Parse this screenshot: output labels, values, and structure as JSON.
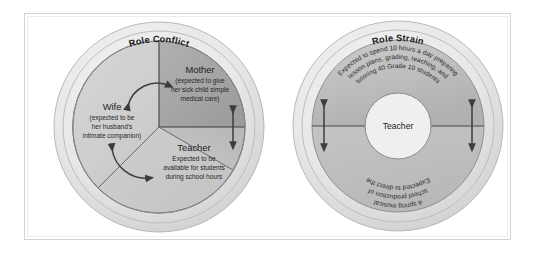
{
  "figure": {
    "background_color": "#ffffff",
    "frame_color": "#d2d2d2",
    "ring_outer_color": "#e9e9e9",
    "ring_inner_color": "#bdbdbd",
    "sector_fill_light": "#cfcfcf",
    "sector_fill_dark": "#a6a6a6",
    "line_color": "#4d4d4d"
  },
  "left_diagram": {
    "title": "Role Conflict",
    "sectors": [
      {
        "name": "mother-sector",
        "role": "Mother",
        "detail_lines": [
          "(expected to give",
          "her sick child simple",
          "medical care)"
        ]
      },
      {
        "name": "wife-sector",
        "role": "Wife",
        "detail_lines": [
          "(expected to be",
          "her husband's",
          "intimate companion)"
        ]
      },
      {
        "name": "teacher-sector",
        "role": "Teacher",
        "detail_lines": [
          "Expected to be",
          "available for students",
          "during school hours"
        ]
      }
    ],
    "arrows": [
      {
        "name": "arrow-wife-mother",
        "style": "curved-double-headed"
      },
      {
        "name": "arrow-mother-teacher",
        "style": "straight-double-headed"
      },
      {
        "name": "arrow-wife-teacher",
        "style": "curved-double-headed"
      }
    ]
  },
  "right_diagram": {
    "title": "Role Strain",
    "center_label": "Teacher",
    "upper_arc_lines": [
      "Expected to spend 10 hours a day preparing",
      "lesson plans, grading, teaching, and",
      "tutoring 40 Grade 10 students"
    ],
    "lower_arc_lines": [
      "Expected to direct the",
      "school production of",
      "a spring musical"
    ],
    "arrows": [
      {
        "name": "arrow-left-strain",
        "style": "straight-double-headed"
      },
      {
        "name": "arrow-right-strain",
        "style": "straight-double-headed"
      }
    ]
  }
}
